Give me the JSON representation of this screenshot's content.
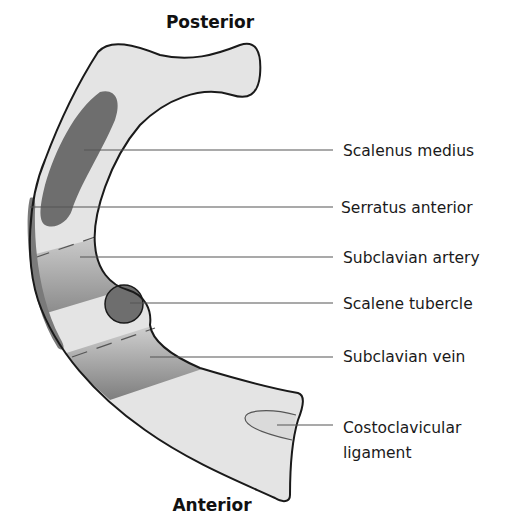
{
  "diagram": {
    "orientation": {
      "top": "Posterior",
      "bottom": "Anterior"
    },
    "labels": [
      {
        "id": "scalenus-medius",
        "text": "Scalenus medius"
      },
      {
        "id": "serratus-anterior",
        "text": "Serratus anterior"
      },
      {
        "id": "subclavian-artery",
        "text": "Subclavian artery"
      },
      {
        "id": "scalene-tubercle",
        "text": "Scalene tubercle"
      },
      {
        "id": "subclavian-vein",
        "text": "Subclavian vein"
      },
      {
        "id": "costoclavicular-ligament",
        "line1": "Costoclavicular",
        "line2": "ligament"
      }
    ],
    "colors": {
      "bone_fill": "#e4e4e4",
      "outline": "#1a1a1a",
      "muscle_dark": "#6e6e6e",
      "groove_dark": "#8a8a8a",
      "groove_light": "#c8c8c8",
      "leader_line": "#555555"
    }
  }
}
